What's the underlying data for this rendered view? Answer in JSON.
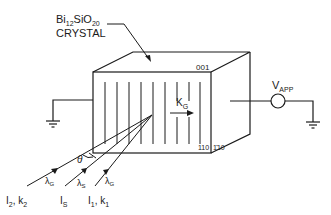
{
  "diagram": {
    "type": "physics-schematic",
    "crystal_label": {
      "formula_base1": "Bi",
      "formula_sub1": "12",
      "formula_base2": "SiO",
      "formula_sub2": "20",
      "line2": "CRYSTAL"
    },
    "crystal_faces": {
      "top": "001",
      "front_bottom_left": "110",
      "front_bottom_right": "1̄10"
    },
    "grating_vector": {
      "base": "K",
      "sub": "G"
    },
    "voltage_source": {
      "base": "V",
      "sub": "APP"
    },
    "angle_label": "θ",
    "beams": [
      {
        "id": "beam-2",
        "wavelength_base": "λ",
        "wavelength_sub": "G",
        "label_base1": "I",
        "label_sub1": "2",
        "sep": ", ",
        "label_base2": "k",
        "label_sub2": "2"
      },
      {
        "id": "beam-s",
        "wavelength_base": "λ",
        "wavelength_sub": "S",
        "label_base1": "I",
        "label_sub1": "S",
        "sep": "",
        "label_base2": "",
        "label_sub2": ""
      },
      {
        "id": "beam-1",
        "wavelength_base": "λ",
        "wavelength_sub": "G",
        "label_base1": "I",
        "label_sub1": "1",
        "sep": ", ",
        "label_base2": "k",
        "label_sub2": "1"
      }
    ],
    "grounds": [
      "left-electrode-ground",
      "right-electrode-ground"
    ],
    "colors": {
      "line": "#1a1a1a",
      "background": "#ffffff"
    }
  }
}
